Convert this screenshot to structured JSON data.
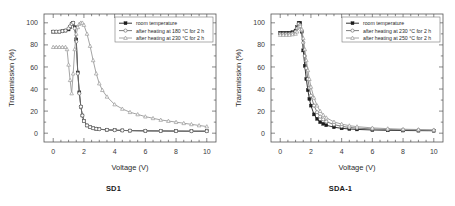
{
  "figure": {
    "panels": [
      {
        "id": "sd1",
        "caption": "SD1",
        "chart_data": {
          "type": "line",
          "title": "",
          "xlabel": "Voltage (V)",
          "ylabel": "Transmission (%)",
          "xlim": [
            -0.6,
            10.6
          ],
          "ylim": [
            -8,
            108
          ],
          "xticks": [
            0,
            2,
            4,
            6,
            8,
            10
          ],
          "yticks": [
            0,
            20,
            40,
            60,
            80,
            100
          ],
          "grid": false,
          "legend_position": "top-right",
          "series": [
            {
              "name": "room temperature",
              "marker": "filled-square",
              "color": "#1c1c1c",
              "x": [
                0.0,
                0.2,
                0.4,
                0.6,
                0.8,
                1.0,
                1.1,
                1.2,
                1.3,
                1.4,
                1.5,
                1.6,
                1.7,
                1.8,
                1.9,
                2.0,
                2.2,
                2.4,
                2.6,
                2.8,
                3.0,
                3.5,
                4.0,
                4.5,
                5.0,
                6.0,
                7.0,
                8.0,
                9.0,
                10.0
              ],
              "y": [
                92,
                92,
                92,
                92.5,
                93,
                94,
                96,
                99,
                100,
                96,
                85,
                55,
                37,
                24,
                16,
                11,
                7,
                5.5,
                4.5,
                4.0,
                3.6,
                3.0,
                2.7,
                2.5,
                2.3,
                2.1,
                2.0,
                1.9,
                1.8,
                1.8
              ]
            },
            {
              "name": "after heating at 180 °C for 2 h",
              "marker": "open-circle",
              "color": "#6f6f6f",
              "x": [
                0.0,
                0.2,
                0.4,
                0.6,
                0.8,
                1.0,
                1.1,
                1.2,
                1.3,
                1.4,
                1.5,
                1.6,
                1.7,
                1.8,
                1.9,
                2.0,
                2.2,
                2.4,
                2.6,
                2.8,
                3.0,
                3.5,
                4.0,
                4.5,
                5.0,
                6.0,
                7.0,
                8.0,
                9.0,
                10.0
              ],
              "y": [
                92,
                92,
                92,
                92.5,
                93,
                95,
                97,
                99,
                100,
                95,
                83,
                54,
                36,
                24,
                16,
                11,
                7,
                5.5,
                4.5,
                4.0,
                3.6,
                3.0,
                2.7,
                2.5,
                2.3,
                2.1,
                2.0,
                1.9,
                1.8,
                1.8
              ]
            },
            {
              "name": "after heating at 230 °C for 2 h",
              "marker": "open-triangle",
              "color": "#9a9a9a",
              "x": [
                0.0,
                0.2,
                0.4,
                0.6,
                0.8,
                0.9,
                1.0,
                1.1,
                1.2,
                1.3,
                1.4,
                1.5,
                1.6,
                1.7,
                1.8,
                1.9,
                2.0,
                2.2,
                2.4,
                2.6,
                2.8,
                3.0,
                3.2,
                3.5,
                4.0,
                4.5,
                5.0,
                5.5,
                6.0,
                6.5,
                7.0,
                7.5,
                8.0,
                8.5,
                9.0,
                9.5,
                10.0
              ],
              "y": [
                78,
                78,
                78,
                78,
                78,
                76,
                62,
                48,
                36,
                54,
                76,
                90,
                96,
                99,
                100,
                100,
                98,
                90,
                79,
                66,
                54,
                45,
                39,
                33,
                26,
                22,
                19,
                17,
                15,
                13.5,
                12,
                11,
                10,
                9,
                8,
                7,
                6
              ]
            }
          ]
        }
      },
      {
        "id": "sda-1",
        "caption": "SDA-1",
        "chart_data": {
          "type": "line",
          "title": "",
          "xlabel": "Voltage (V)",
          "ylabel": "Transmission (%)",
          "xlim": [
            -0.6,
            10.6
          ],
          "ylim": [
            -8,
            108
          ],
          "xticks": [
            0,
            2,
            4,
            6,
            8,
            10
          ],
          "yticks": [
            0,
            20,
            40,
            60,
            80,
            100
          ],
          "grid": false,
          "legend_position": "top-right",
          "series": [
            {
              "name": "room temperature",
              "marker": "filled-square",
              "color": "#1c1c1c",
              "x": [
                0.0,
                0.2,
                0.4,
                0.6,
                0.8,
                1.0,
                1.1,
                1.2,
                1.3,
                1.4,
                1.5,
                1.6,
                1.7,
                1.8,
                1.9,
                2.0,
                2.2,
                2.4,
                2.6,
                2.8,
                3.0,
                3.5,
                4.0,
                4.5,
                5.0,
                6.0,
                7.0,
                8.0,
                9.0,
                10.0
              ],
              "y": [
                91,
                91,
                91,
                91,
                91.5,
                93,
                96,
                100,
                100,
                92,
                75,
                61,
                49,
                39,
                31,
                25,
                17,
                13,
                10,
                8.5,
                7.2,
                5.4,
                4.4,
                3.8,
                3.4,
                2.9,
                2.6,
                2.4,
                2.3,
                2.2
              ]
            },
            {
              "name": "after heating at 230 °C for 2 h",
              "marker": "open-circle",
              "color": "#6f6f6f",
              "x": [
                0.0,
                0.2,
                0.4,
                0.6,
                0.8,
                1.0,
                1.1,
                1.2,
                1.3,
                1.4,
                1.5,
                1.6,
                1.7,
                1.8,
                1.9,
                2.0,
                2.2,
                2.4,
                2.6,
                2.8,
                3.0,
                3.5,
                4.0,
                4.5,
                5.0,
                6.0,
                7.0,
                8.0,
                9.0,
                10.0
              ],
              "y": [
                90,
                90,
                90,
                90,
                90.5,
                92,
                95,
                99,
                98,
                93,
                82,
                70,
                59,
                49,
                41,
                34,
                25,
                19,
                15,
                12.5,
                10.5,
                7.8,
                6.2,
                5.2,
                4.6,
                3.8,
                3.3,
                3.0,
                2.8,
                2.6
              ]
            },
            {
              "name": "after heating at 250 °C for 2 h",
              "marker": "open-triangle",
              "color": "#9a9a9a",
              "x": [
                0.0,
                0.2,
                0.4,
                0.6,
                0.8,
                1.0,
                1.1,
                1.2,
                1.3,
                1.4,
                1.5,
                1.6,
                1.7,
                1.8,
                1.9,
                2.0,
                2.2,
                2.4,
                2.6,
                2.8,
                3.0,
                3.5,
                4.0,
                4.5,
                5.0,
                6.0,
                7.0,
                8.0,
                9.0,
                10.0
              ],
              "y": [
                89,
                89,
                89,
                89,
                89.5,
                90,
                92,
                96,
                97,
                94,
                86,
                76,
                66,
                57,
                49,
                42,
                32,
                25,
                20,
                16.5,
                14,
                10.2,
                8.2,
                6.8,
                5.9,
                4.8,
                4.1,
                3.6,
                3.3,
                3.0
              ]
            }
          ]
        }
      }
    ]
  }
}
